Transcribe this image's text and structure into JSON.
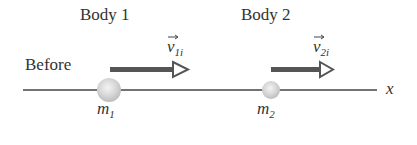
{
  "diagram": {
    "body1_label": "Body 1",
    "body2_label": "Body 2",
    "stage_label": "Before",
    "v1_base": "v",
    "v1_sub": "1i",
    "v2_base": "v",
    "v2_sub": "2i",
    "m1_base": "m",
    "m1_sub": "1",
    "m2_base": "m",
    "m2_sub": "2",
    "axis_label": "x"
  }
}
